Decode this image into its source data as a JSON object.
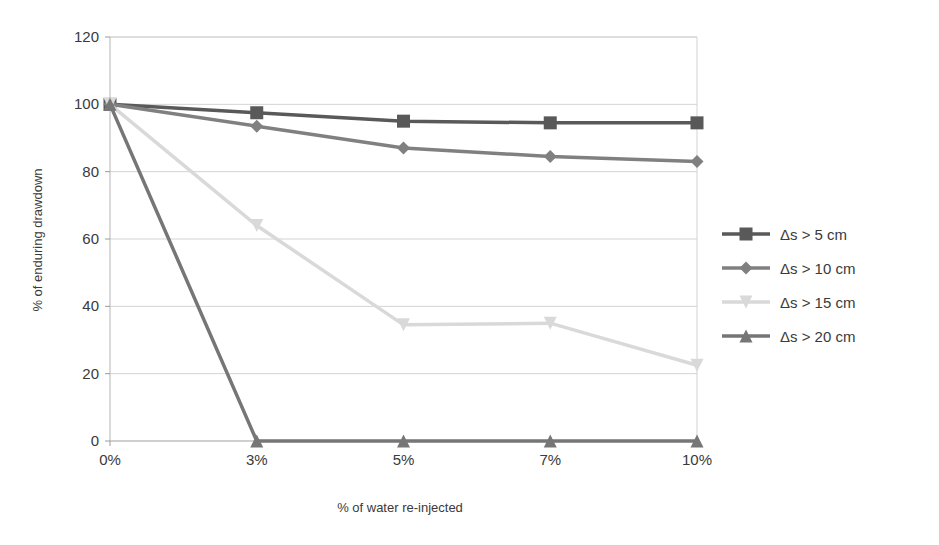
{
  "chart_data": {
    "type": "line",
    "title": "",
    "xlabel": "% of water re-injected",
    "ylabel": "% of enduring drawdown",
    "categories": [
      "0%",
      "3%",
      "5%",
      "7%",
      "10%"
    ],
    "x_values": [
      0,
      3,
      5,
      7,
      10
    ],
    "ylim": [
      0,
      120
    ],
    "y_ticks": [
      0,
      20,
      40,
      60,
      80,
      100,
      120
    ],
    "grid": "horizontal",
    "legend_position": "right",
    "series": [
      {
        "name": "Δs > 5 cm",
        "marker": "square",
        "color": "#595959",
        "values": [
          100,
          97.5,
          95,
          94.5,
          94.5
        ]
      },
      {
        "name": "Δs > 10 cm",
        "marker": "diamond",
        "color": "#808080",
        "values": [
          100,
          93.5,
          87,
          84.5,
          83
        ]
      },
      {
        "name": "Δs > 15 cm",
        "marker": "triangle-down",
        "color": "#d9d9d9",
        "values": [
          100,
          64,
          34.5,
          35,
          22.5
        ]
      },
      {
        "name": "Δs > 20 cm",
        "marker": "triangle-up",
        "color": "#767676",
        "values": [
          100,
          0,
          0,
          0,
          0
        ]
      }
    ]
  },
  "axes": {
    "y_tick_labels": [
      "120",
      "100",
      "80",
      "60",
      "40",
      "20",
      "0"
    ],
    "x_tick_labels": [
      "0%",
      "3%",
      "5%",
      "7%",
      "10%"
    ],
    "y_axis_title": "% of enduring drawdown",
    "x_axis_title": "% of water re-injected"
  },
  "legend": {
    "items": [
      {
        "label": "Δs > 5 cm",
        "color": "#595959",
        "marker": "square"
      },
      {
        "label": "Δs > 10 cm",
        "color": "#808080",
        "marker": "diamond"
      },
      {
        "label": "Δs > 15 cm",
        "color": "#d9d9d9",
        "marker": "triangle-down"
      },
      {
        "label": "Δs > 20 cm",
        "color": "#767676",
        "marker": "triangle-up"
      }
    ]
  },
  "colors": {
    "background": "#ffffff",
    "gridline": "#d3d3d3",
    "axis": "#b5b5b5",
    "text": "#3a3a3a"
  }
}
